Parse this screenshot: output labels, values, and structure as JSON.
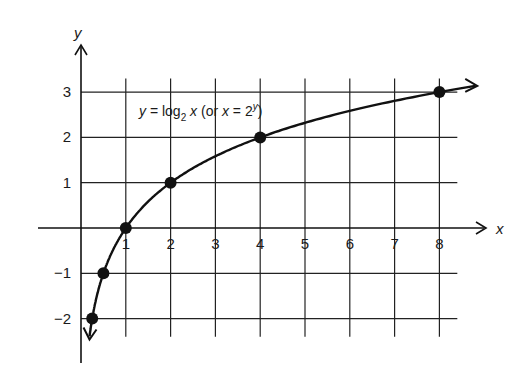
{
  "chart_data": {
    "type": "line",
    "title": "",
    "annotation": {
      "lhs": "y",
      "eq": " = log",
      "sub": "2",
      "var": " x",
      "rest_open": " (or ",
      "rest_var": "x",
      "rest_eq": " = 2",
      "sup": "y",
      "rest_close": ")"
    },
    "xlabel": "x",
    "ylabel": "y",
    "xlim": [
      -1,
      8.5
    ],
    "ylim": [
      -2.5,
      3.5
    ],
    "grid": true,
    "x_ticks": [
      "1",
      "2",
      "3",
      "4",
      "5",
      "6",
      "7",
      "8"
    ],
    "y_ticks": [
      "3",
      "2",
      "1",
      "-1",
      "-2"
    ],
    "series": [
      {
        "name": "y = log2 x",
        "function": "log2",
        "x": [
          0.25,
          0.5,
          1,
          2,
          4,
          8
        ],
        "y": [
          -2,
          -1,
          0,
          1,
          2,
          3
        ],
        "markers": true,
        "arrows_both_ends": true
      }
    ],
    "color": "#111111"
  }
}
